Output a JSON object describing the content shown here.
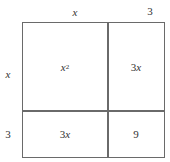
{
  "diagram": {
    "top_labels": [
      {
        "text": "x",
        "italic": true
      },
      {
        "text": "3",
        "italic": false
      }
    ],
    "side_labels": [
      {
        "text": "x",
        "italic": true
      },
      {
        "text": "3",
        "italic": false
      }
    ],
    "cells": [
      {
        "row": 0,
        "col": 0,
        "base": "x",
        "sup": "2"
      },
      {
        "row": 0,
        "col": 1,
        "coef": "3",
        "var": "x"
      },
      {
        "row": 1,
        "col": 0,
        "coef": "3",
        "var": "x"
      },
      {
        "row": 1,
        "col": 1,
        "text": "9"
      }
    ],
    "line_color": "#6a6a6a",
    "text_color": "#333333"
  }
}
